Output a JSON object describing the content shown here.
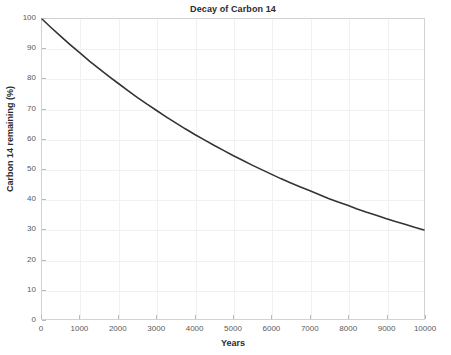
{
  "chart_data": {
    "type": "line",
    "title": "Decay of Carbon 14",
    "xlabel": "Years",
    "ylabel": "Carbon 14 remaining (%)",
    "xlim": [
      0,
      10000
    ],
    "ylim": [
      0,
      100
    ],
    "grid": true,
    "legend": null,
    "series_color": "#333333",
    "xticks": [
      0,
      1000,
      2000,
      3000,
      4000,
      5000,
      6000,
      7000,
      8000,
      9000,
      10000
    ],
    "xtick_labels": [
      "0",
      "1000",
      "2000",
      "3000",
      "4000",
      "5000",
      "6000",
      "7000",
      "8000",
      "9000",
      "10000"
    ],
    "yticks": [
      0,
      10,
      20,
      30,
      40,
      50,
      60,
      70,
      80,
      90,
      100
    ],
    "ytick_labels": [
      "0",
      "10",
      "20",
      "30",
      "40",
      "50",
      "60",
      "70",
      "80",
      "90",
      "100"
    ],
    "series": [
      {
        "name": "Carbon 14 remaining",
        "x": [
          0,
          250,
          500,
          750,
          1000,
          1250,
          1500,
          1750,
          2000,
          2250,
          2500,
          2750,
          3000,
          3250,
          3500,
          3750,
          4000,
          4250,
          4500,
          4750,
          5000,
          5250,
          5500,
          5750,
          6000,
          6250,
          6500,
          6750,
          7000,
          7250,
          7500,
          7750,
          8000,
          8250,
          8500,
          8750,
          9000,
          9250,
          9500,
          9750,
          10000
        ],
        "values": [
          100.0,
          97.0,
          94.1,
          91.3,
          88.6,
          85.9,
          83.4,
          80.9,
          78.5,
          76.1,
          73.8,
          71.6,
          69.5,
          67.4,
          65.4,
          63.4,
          61.5,
          59.7,
          57.9,
          56.2,
          54.5,
          52.9,
          51.3,
          49.8,
          48.3,
          46.8,
          45.4,
          44.1,
          42.8,
          41.5,
          40.2,
          39.0,
          37.9,
          36.7,
          35.6,
          34.6,
          33.5,
          32.5,
          31.6,
          30.6,
          29.7
        ]
      }
    ],
    "half_life_years": 5730,
    "annotation": null
  }
}
